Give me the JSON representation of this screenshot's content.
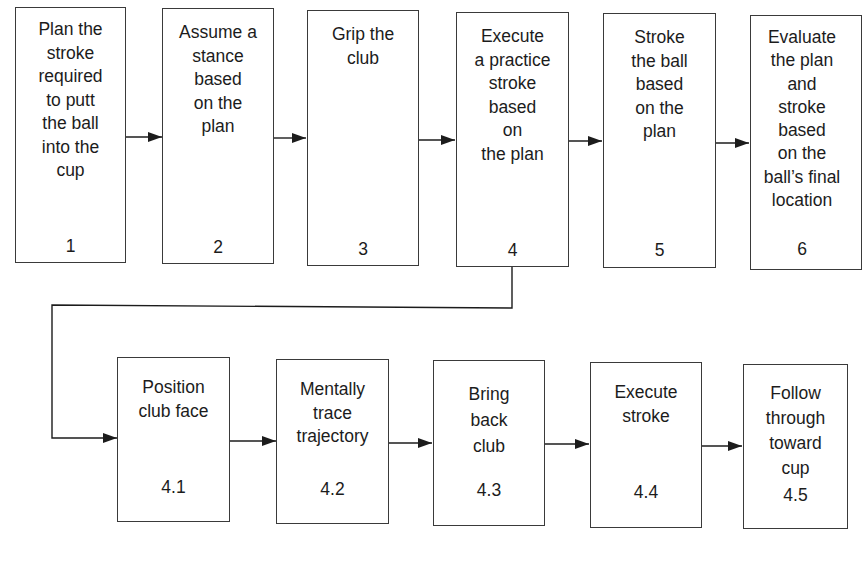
{
  "diagram": {
    "type": "flowchart",
    "main_steps": [
      {
        "id": "1",
        "label": "Plan the\nstroke\nrequired\nto putt\nthe ball\ninto the\ncup",
        "number": "1"
      },
      {
        "id": "2",
        "label": "Assume a\nstance\nbased\non the\nplan",
        "number": "2"
      },
      {
        "id": "3",
        "label": "Grip the\nclub",
        "number": "3"
      },
      {
        "id": "4",
        "label": "Execute\na practice\nstroke\nbased\non\nthe plan",
        "number": "4"
      },
      {
        "id": "5",
        "label": "Stroke\nthe ball\nbased\non the\nplan",
        "number": "5"
      },
      {
        "id": "6",
        "label": "Evaluate\nthe plan\nand\nstroke\nbased\non the\nball’s final\nlocation",
        "number": "6"
      }
    ],
    "sub_steps": [
      {
        "id": "4.1",
        "label": "Position\nclub face",
        "number": "4.1"
      },
      {
        "id": "4.2",
        "label": "Mentally\ntrace\ntrajectory",
        "number": "4.2"
      },
      {
        "id": "4.3",
        "label": "Bring\nback\nclub",
        "number": "4.3"
      },
      {
        "id": "4.4",
        "label": "Execute\nstroke",
        "number": "4.4"
      },
      {
        "id": "4.5",
        "label": "Follow\nthrough\ntoward\ncup",
        "number": "4.5"
      }
    ],
    "edges": [
      [
        "1",
        "2"
      ],
      [
        "2",
        "3"
      ],
      [
        "3",
        "4"
      ],
      [
        "4",
        "5"
      ],
      [
        "5",
        "6"
      ],
      [
        "4",
        "4.1"
      ],
      [
        "4.1",
        "4.2"
      ],
      [
        "4.2",
        "4.3"
      ],
      [
        "4.3",
        "4.4"
      ],
      [
        "4.4",
        "4.5"
      ]
    ],
    "colors": {
      "line": "#1c1c1c",
      "border": "#3a3a3a",
      "background": "#ffffff"
    }
  }
}
